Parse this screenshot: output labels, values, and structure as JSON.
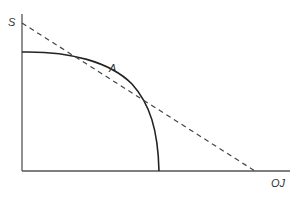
{
  "diagram": {
    "type": "production-possibility-frontier",
    "y_axis_label": "S",
    "x_axis_label": "OJ",
    "point_label": "A",
    "curve": "concave frontier from y-axis to x-axis",
    "tangent_line": "dashed straight line tangent to the curve at A"
  },
  "colors": {
    "axis": "#555555",
    "curve": "#222222",
    "dashed": "#444444",
    "text": "#333333"
  }
}
